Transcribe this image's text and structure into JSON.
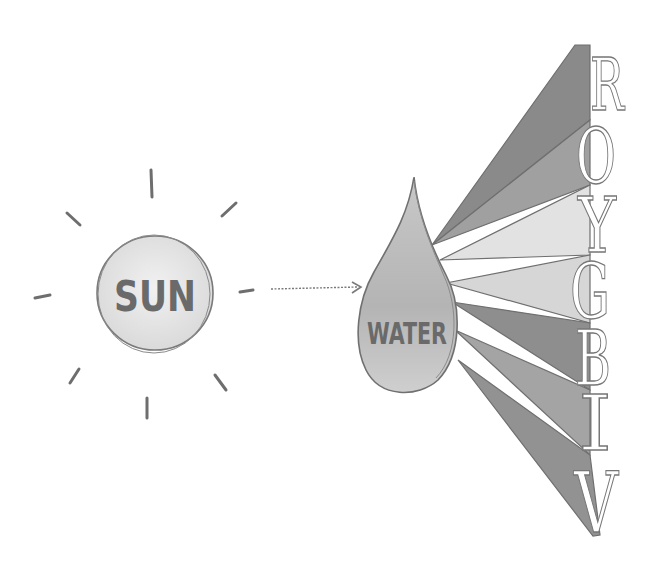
{
  "diagram": {
    "title": "",
    "source": {
      "label": "SUN",
      "ray_count": 8
    },
    "arrow": {
      "style": "dotted",
      "from": "SUN",
      "to": "WATER"
    },
    "medium": {
      "label": "WATER",
      "shape": "droplet"
    },
    "spectrum": {
      "bands": [
        {
          "letter": "R",
          "color": "#8a8a8a"
        },
        {
          "letter": "O",
          "color": "#a0a0a0"
        },
        {
          "letter": "Y",
          "color": "#e2e2e2"
        },
        {
          "letter": "G",
          "color": "#d2d2d2"
        },
        {
          "letter": "B",
          "color": "#8e8e8e"
        },
        {
          "letter": "I",
          "color": "#a4a4a4"
        },
        {
          "letter": "V",
          "color": "#929292"
        }
      ]
    }
  }
}
